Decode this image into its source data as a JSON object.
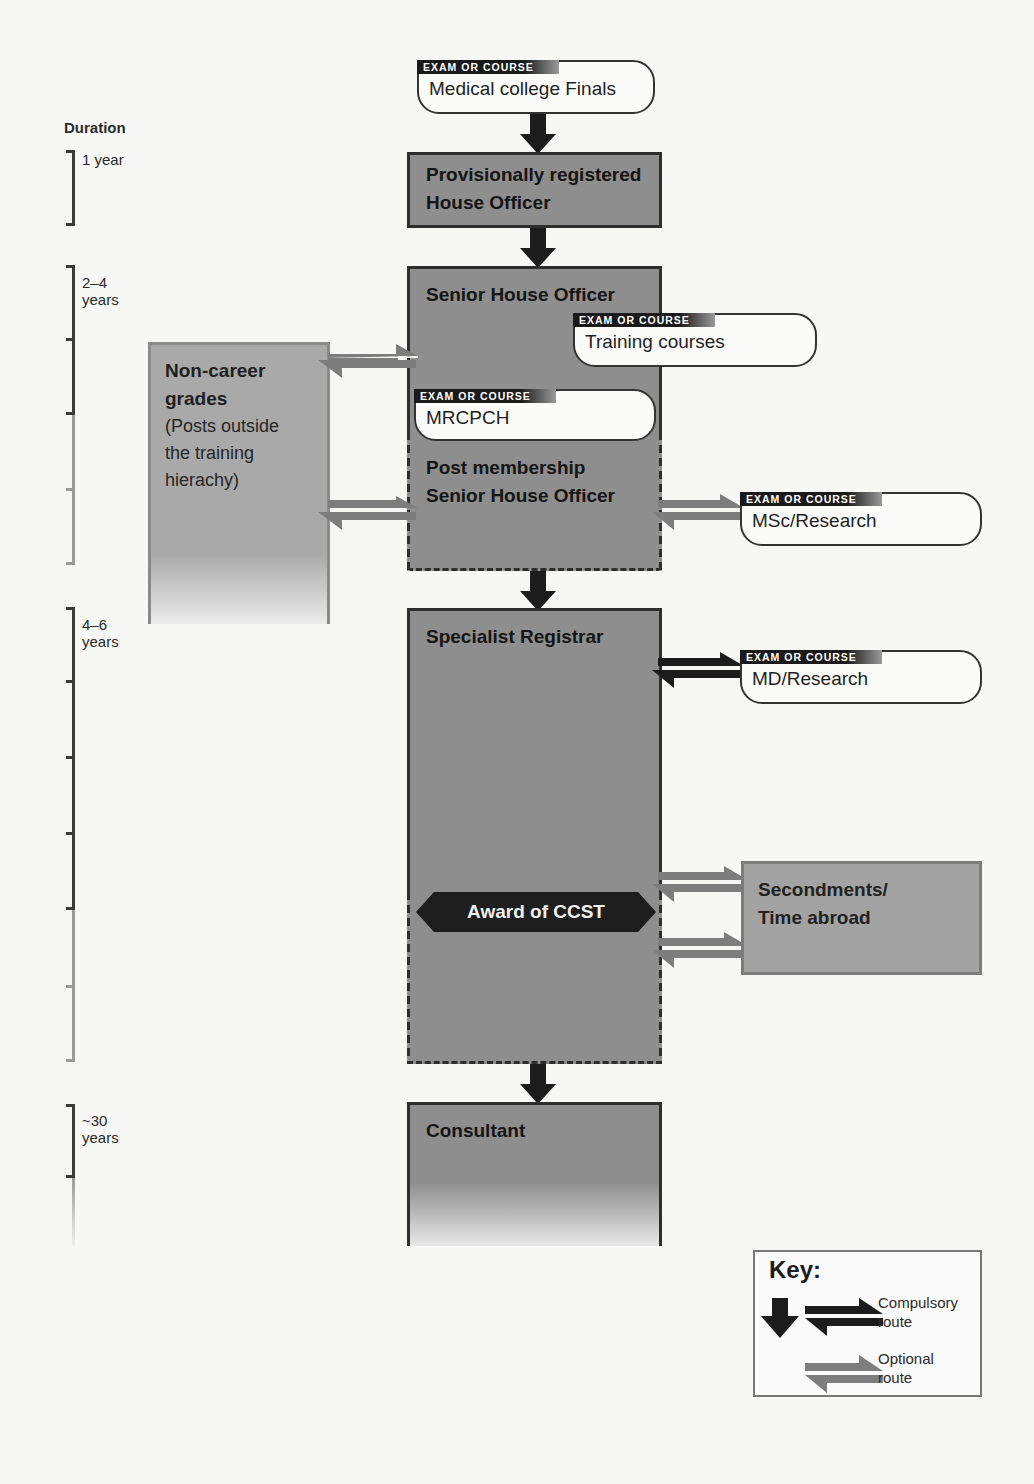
{
  "duration": {
    "title": "Duration",
    "ranges": [
      {
        "label": "1 year"
      },
      {
        "label": "2–4 years",
        "line1": "2–4",
        "line2": "years"
      },
      {
        "label": "4–6 years",
        "line1": "4–6",
        "line2": "years"
      },
      {
        "label": "~30 years",
        "line1": "~30",
        "line2": "years"
      }
    ]
  },
  "exam_tag": "EXAM OR COURSE",
  "exams": {
    "finals": "Medical college Finals",
    "training": "Training courses",
    "mrcpch": "MRCPCH",
    "msc": "MSc/Research",
    "md": "MD/Research"
  },
  "grades": {
    "pr_house_officer_line1": "Provisionally registered",
    "pr_house_officer_line2": "House Officer",
    "sho": "Senior House Officer",
    "post_membership_line1": "Post membership",
    "post_membership_line2": "Senior House Officer",
    "spr": "Specialist Registrar",
    "consultant": "Consultant"
  },
  "non_career": {
    "title_line1": "Non-career",
    "title_line2": "grades",
    "desc_line1": "(Posts outside",
    "desc_line2": "the training",
    "desc_line3": "hierachy)"
  },
  "secondments": {
    "line1": "Secondments/",
    "line2": "Time abroad"
  },
  "milestone": "Award of CCST",
  "key": {
    "title": "Key:",
    "compulsory_line1": "Compulsory",
    "compulsory_line2": "route",
    "optional_line1": "Optional",
    "optional_line2": "route"
  },
  "colors": {
    "box_fill": "#8e8e8e",
    "compulsory_arrow": "#1c1c1c",
    "optional_arrow": "#7d7d7d",
    "side_box_fill": "#a9a9a9"
  }
}
